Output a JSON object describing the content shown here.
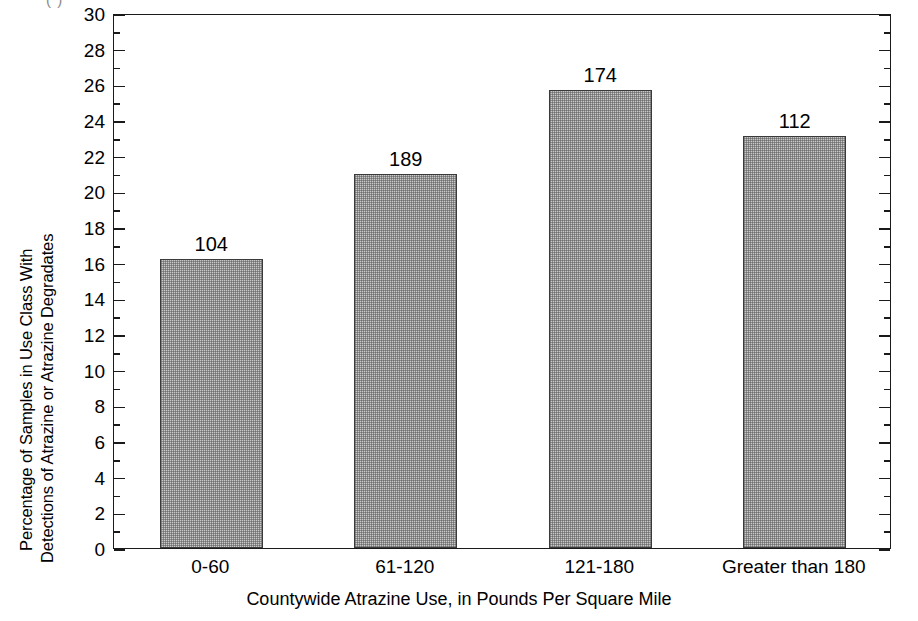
{
  "figure": {
    "cropped_header_text": "(     )",
    "background_color": "#ffffff",
    "axis_color": "#1a1a1a",
    "bar_fill_color": "#c9c9c9",
    "bar_edge_color": "#3a3a3a"
  },
  "chart_data": {
    "type": "bar",
    "title": "",
    "subtitle": "",
    "xlabel": "Countywide Atrazine Use, in Pounds Per Square Mile",
    "ylabel": "Percentage of Samples in Use Class With Detections of Atrazine or Atrazine Degradates",
    "ylabel_lines": [
      "Percentage of Samples in Use Class With",
      "Detections of Atrazine or Atrazine Degradates"
    ],
    "categories": [
      "0-60",
      "61-120",
      "121-180",
      "Greater than 180"
    ],
    "values": [
      16.2,
      21.0,
      25.7,
      23.1
    ],
    "point_labels": [
      "104",
      "189",
      "174",
      "112"
    ],
    "point_label_meaning": "number of samples in use class",
    "ylim": [
      0,
      30
    ],
    "ytick_step": 2,
    "ytick_minor_step": 1,
    "yticks": [
      "0",
      "2",
      "4",
      "6",
      "8",
      "10",
      "12",
      "14",
      "16",
      "18",
      "20",
      "22",
      "24",
      "26",
      "28",
      "30"
    ],
    "grid": false,
    "legend": null,
    "legend_position": "none",
    "series": [
      {
        "name": "Percentage with detections",
        "values": [
          16.2,
          21.0,
          25.7,
          23.1
        ],
        "labels": [
          "104",
          "189",
          "174",
          "112"
        ]
      }
    ]
  }
}
